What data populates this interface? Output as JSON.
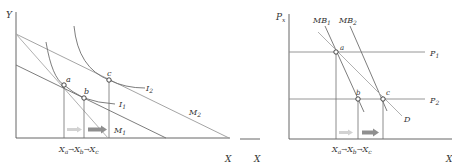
{
  "colors": {
    "axis": "#555555",
    "line_dark": "#6e6e6e",
    "line_light": "#a8a8a8",
    "point_fill": "#ffffff",
    "point_stroke": "#333333",
    "arrow_light": "#d2d2d2",
    "arrow_dark": "#8f8f8f",
    "text": "#333333"
  },
  "left_panel": {
    "y_axis_label": "Y",
    "x_axis_label": "X",
    "budget_lines": [
      {
        "id": "M1",
        "label": "M",
        "sub": "1"
      },
      {
        "id": "M2",
        "label": "M",
        "sub": "2"
      }
    ],
    "indifference_curves": [
      {
        "id": "I1",
        "label": "I",
        "sub": "1"
      },
      {
        "id": "I2",
        "label": "I",
        "sub": "2"
      }
    ],
    "points": [
      {
        "id": "a",
        "label": "a"
      },
      {
        "id": "b",
        "label": "b"
      },
      {
        "id": "c",
        "label": "c"
      }
    ],
    "x_ticks": {
      "xa": {
        "label": "X",
        "sub": "a"
      },
      "xb": {
        "label": "X",
        "sub": "b"
      },
      "xc": {
        "label": "X",
        "sub": "c"
      },
      "arrow": "→"
    }
  },
  "right_panel": {
    "y_axis_label": "P",
    "y_axis_sub": "x",
    "x_axis_label": "X",
    "curves": [
      {
        "id": "MB1",
        "label": "MB",
        "sub": "1"
      },
      {
        "id": "MB2",
        "label": "MB",
        "sub": "2"
      },
      {
        "id": "D",
        "label": "D"
      }
    ],
    "price_lines": [
      {
        "id": "P1",
        "label": "P",
        "sub": "1"
      },
      {
        "id": "P2",
        "label": "P",
        "sub": "2"
      }
    ],
    "points": [
      {
        "id": "a",
        "label": "a"
      },
      {
        "id": "b",
        "label": "b"
      },
      {
        "id": "c",
        "label": "c"
      }
    ],
    "x_ticks": {
      "xa": {
        "label": "X",
        "sub": "a"
      },
      "xb": {
        "label": "X",
        "sub": "b"
      },
      "xc": {
        "label": "X",
        "sub": "c"
      },
      "arrow": "→"
    }
  }
}
